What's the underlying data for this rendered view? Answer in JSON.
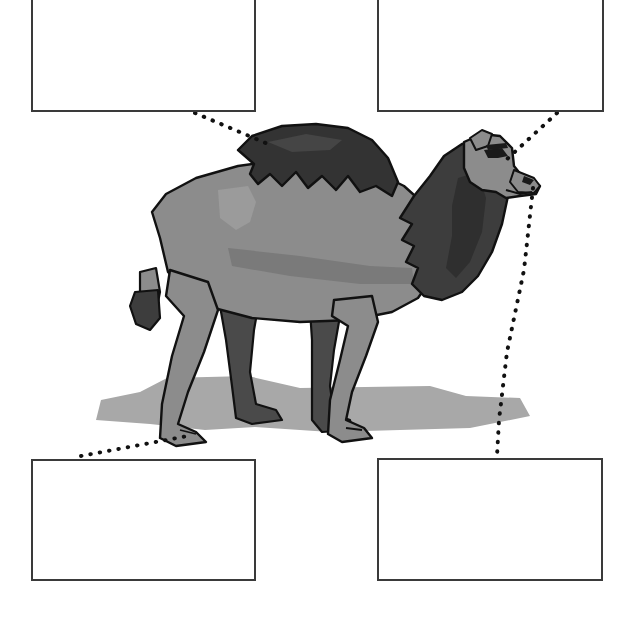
{
  "worksheet": {
    "kind": "anatomy-labeling-worksheet",
    "subject": "camel",
    "background_color": "#ffffff"
  },
  "label_boxes": [
    {
      "id": "label-box-top-left",
      "text": "",
      "placeholder": "",
      "x": 31,
      "y": 0,
      "width": 225,
      "height": 112,
      "border_color": "#3a3a3a"
    },
    {
      "id": "label-box-top-right",
      "text": "",
      "placeholder": "",
      "x": 377,
      "y": 0,
      "width": 227,
      "height": 112,
      "border_color": "#3a3a3a"
    },
    {
      "id": "label-box-bottom-left",
      "text": "",
      "placeholder": "",
      "x": 31,
      "y": 459,
      "width": 225,
      "height": 122,
      "border_color": "#3a3a3a"
    },
    {
      "id": "label-box-bottom-right",
      "text": "",
      "placeholder": "",
      "x": 377,
      "y": 458,
      "width": 226,
      "height": 123,
      "border_color": "#3a3a3a"
    }
  ],
  "leader_lines": [
    {
      "id": "leader-line-hump",
      "from_box": "label-box-top-left",
      "points": "195,113 268,144",
      "style": "dotted",
      "color": "#111111"
    },
    {
      "id": "leader-line-head",
      "from_box": "label-box-top-right",
      "points": "557,113 506,160",
      "style": "dotted",
      "color": "#111111"
    },
    {
      "id": "leader-line-foot",
      "from_box": "label-box-bottom-left",
      "points": "81,456 193,435",
      "style": "dotted",
      "color": "#111111"
    },
    {
      "id": "leader-line-mouth",
      "from_box": "label-box-bottom-right",
      "points": "533,188 524,270 507,352 499,420 497,456",
      "style": "dotted",
      "color": "#111111"
    }
  ],
  "illustration": {
    "name": "camel-illustration",
    "colors": {
      "body": "#8c8c8c",
      "body_shade": "#7a7a7a",
      "body_shade_light": "#979797",
      "mane_dark": "#3d3d3d",
      "mane_darker": "#2f2f2f",
      "hump_fur": "#333333",
      "leg_far": "#4a4a4a",
      "shadow": "#a8a8a8",
      "outline": "#111111",
      "highlight": "#9b9b9b"
    },
    "parts": [
      "hump-fur",
      "neck-mane",
      "head",
      "muzzle",
      "eye",
      "nostril",
      "body",
      "foreleg-near",
      "foreleg-far",
      "hindleg-near",
      "hindleg-far",
      "tail",
      "ground-shadow"
    ]
  }
}
